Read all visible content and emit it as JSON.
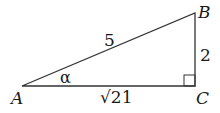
{
  "diagram": {
    "type": "right-triangle",
    "vertices": [
      {
        "label": "A",
        "x": 22,
        "y": 86
      },
      {
        "label": "B",
        "x": 195,
        "y": 13
      },
      {
        "label": "C",
        "x": 195,
        "y": 86
      }
    ],
    "sides": {
      "hypotenuse_AB": "5",
      "side_BC": "2",
      "side_AC": "√21"
    },
    "angle_label": "α",
    "right_angle_at": "C",
    "stroke_color": "#333333"
  }
}
